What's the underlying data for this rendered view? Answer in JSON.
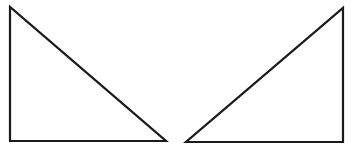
{
  "diagram": {
    "stroke_color": "#1a1a1a",
    "background": "#ffffff",
    "shapes": [
      {
        "name": "left-right-triangle",
        "points": "10,7 10,141 166,141",
        "right_angle_vertex": "bottom-left"
      },
      {
        "name": "right-right-triangle",
        "points": "343,8 343,142 186,142",
        "right_angle_vertex": "bottom-right"
      }
    ]
  }
}
